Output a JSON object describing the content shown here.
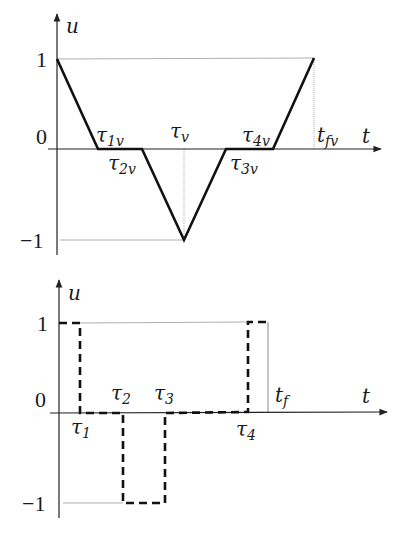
{
  "top_plot": {
    "y_axis_label": "u",
    "x_axis_label": "t",
    "y_ticks": [
      "1",
      "0",
      "−1"
    ],
    "labels": {
      "tau1v": {
        "base": "τ",
        "sub": "1v"
      },
      "tau2v": {
        "base": "τ",
        "sub": "2v"
      },
      "tauv": {
        "base": "τ",
        "sub": "v"
      },
      "tau3v": {
        "base": "τ",
        "sub": "3v"
      },
      "tau4v": {
        "base": "τ",
        "sub": "4v"
      },
      "tfv": {
        "base": "t",
        "sub": "fv"
      }
    },
    "line_style": "solid"
  },
  "bottom_plot": {
    "y_axis_label": "u",
    "x_axis_label": "t",
    "y_ticks": [
      "1",
      "0",
      "−1"
    ],
    "labels": {
      "tau1": {
        "base": "τ",
        "sub": "1"
      },
      "tau2": {
        "base": "τ",
        "sub": "2"
      },
      "tau3": {
        "base": "τ",
        "sub": "3"
      },
      "tau4": {
        "base": "τ",
        "sub": "4"
      },
      "tf": {
        "base": "t",
        "sub": "f"
      }
    },
    "line_style": "dashed"
  },
  "colors": {
    "line": "#111111",
    "guide": "#888888",
    "axis": "#222222"
  }
}
